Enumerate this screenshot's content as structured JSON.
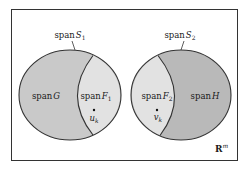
{
  "diagram": {
    "frame": {
      "label_main": "R",
      "label_sup": "m"
    },
    "colors": {
      "background": "#ffffff",
      "frame_stroke": "#333333",
      "outline": "#333333",
      "span_G_fill": "#c9c9c9",
      "span_F_fill": "#e2e2e2",
      "span_H_fill": "#b9b9b9"
    },
    "left_set": {
      "outer_label": {
        "prefix": "span",
        "symbol": "S",
        "subscript": "1"
      },
      "region_outer": {
        "prefix": "span",
        "symbol": "G"
      },
      "region_inner": {
        "prefix": "span",
        "symbol": "F",
        "subscript": "1"
      },
      "point": {
        "symbol": "u",
        "subscript": "k"
      }
    },
    "right_set": {
      "outer_label": {
        "prefix": "span",
        "symbol": "S",
        "subscript": "2"
      },
      "region_inner": {
        "prefix": "span",
        "symbol": "F",
        "subscript": "2"
      },
      "region_outer": {
        "prefix": "span",
        "symbol": "H"
      },
      "point": {
        "symbol": "v",
        "subscript": "k"
      }
    }
  }
}
